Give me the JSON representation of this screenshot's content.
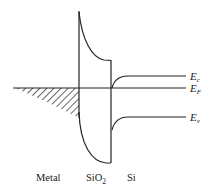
{
  "diagram": {
    "type": "MOS energy band diagram",
    "regions": [
      {
        "id": "metal",
        "label": "Metal"
      },
      {
        "id": "oxide",
        "label": "SiO",
        "subscript": "2"
      },
      {
        "id": "semiconductor",
        "label": "Si"
      }
    ],
    "levels": [
      {
        "id": "conduction-band",
        "label": "E",
        "subscript": "c"
      },
      {
        "id": "fermi-level",
        "label": "E",
        "subscript": "F"
      },
      {
        "id": "valence-band",
        "label": "E",
        "subscript": "v"
      }
    ],
    "colors": {
      "line": "#222222",
      "background": "#ffffff"
    }
  }
}
